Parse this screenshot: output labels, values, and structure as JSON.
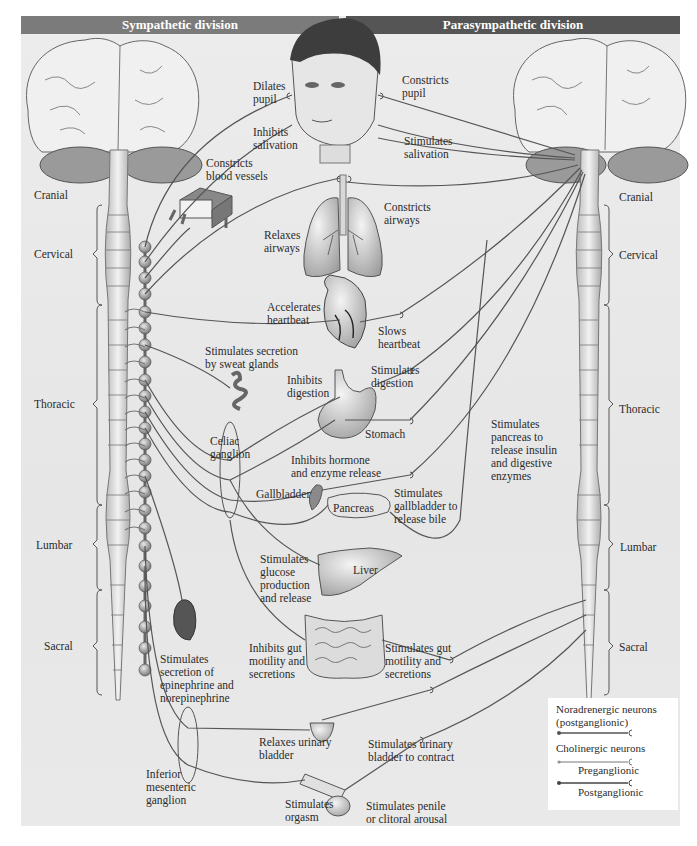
{
  "headers": {
    "sympathetic": "Sympathetic division",
    "parasympathetic": "Parasympathetic division"
  },
  "spine_segments": {
    "left": [
      "Cranial",
      "Cervical",
      "Thoracic",
      "Lumbar",
      "Sacral"
    ],
    "right": [
      "Cranial",
      "Cervical",
      "Thoracic",
      "Lumbar",
      "Sacral"
    ]
  },
  "sympathetic_effects": {
    "dilates_pupil": "Dilates\npupil",
    "inhibits_salivation": "Inhibits\nsalivation",
    "constricts_blood_vessels": "Constricts\nblood vessels",
    "relaxes_airways": "Relaxes\nairways",
    "accelerates_heartbeat": "Accelerates\nheartbeat",
    "sweat_glands": "Stimulates secretion\nby sweat glands",
    "inhibits_digestion": "Inhibits\ndigestion",
    "inhibits_hormone": "Inhibits hormone\nand enzyme release",
    "glucose": "Stimulates\nglucose\nproduction\nand release",
    "inhibits_gut": "Inhibits gut\nmotility and\nsecretions",
    "epinephrine": "Stimulates\nsecretion of\nepinephrine and\nnorepinephrine",
    "relaxes_bladder": "Relaxes urinary\nbladder",
    "orgasm": "Stimulates\norgasm"
  },
  "parasympathetic_effects": {
    "constricts_pupil": "Constricts\npupil",
    "stimulates_salivation": "Stimulates\nsalivation",
    "constricts_airways": "Constricts\nairways",
    "slows_heartbeat": "Slows\nheartbeat",
    "stimulates_digestion": "Stimulates\ndigestion",
    "pancreas_insulin": "Stimulates\npancreas to\nrelease insulin\nand digestive\nenzymes",
    "gallbladder_bile": "Stimulates\ngallbladder to\nrelease bile",
    "stimulates_gut": "Stimulates gut\nmotility and\nsecretions",
    "bladder_contract": "Stimulates urinary\nbladder to contract",
    "arousal": "Stimulates penile\nor clitoral arousal"
  },
  "organs": {
    "stomach": "Stomach",
    "gallbladder": "Gallbladder",
    "pancreas": "Pancreas",
    "liver": "Liver"
  },
  "ganglia": {
    "celiac": "Celiac\nganglion",
    "inferior_mesenteric": "Inferior\nmesenteric\nganglion"
  },
  "legend": {
    "noradrenergic": "Noradrenergic neurons\n(postganglionic)",
    "cholinergic": "Cholinergic neurons",
    "preganglionic": "Preganglionic",
    "postganglionic": "Postganglionic"
  },
  "colors": {
    "header_sympathetic": "#7b7b7b",
    "header_parasympathetic": "#555555",
    "nerve": "#555555",
    "background": "#e9e9e9"
  }
}
